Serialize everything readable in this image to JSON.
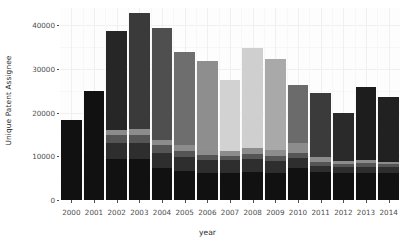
{
  "chart_data": {
    "type": "bar",
    "barmode": "stacked",
    "title": "",
    "xlabel": "year",
    "ylabel": "Unique Patent Assignee",
    "categories": [
      "2000",
      "2001",
      "2002",
      "2003",
      "2004",
      "2005",
      "2006",
      "2007",
      "2008",
      "2009",
      "2010",
      "2011",
      "2012",
      "2013",
      "2014"
    ],
    "ylim": [
      0,
      44000
    ],
    "yticks": [
      0,
      10000,
      20000,
      30000,
      40000
    ],
    "ytick_labels": [
      "0",
      "10000",
      "20000",
      "30000",
      "40000"
    ],
    "grid": true,
    "legend": "none",
    "totals": [
      18400,
      25000,
      38800,
      42800,
      39400,
      34000,
      31800,
      27600,
      34900,
      32300,
      26400,
      24500,
      19900,
      26000,
      23700
    ],
    "series": [
      {
        "name": "group-1",
        "color": "#111111",
        "values": [
          18400,
          25000,
          9300,
          9500,
          7300,
          6600,
          6300,
          6300,
          6500,
          6300,
          7400,
          6400,
          6200,
          6300,
          6300
        ]
      },
      {
        "name": "group-2",
        "color": "#2e2e2e",
        "values": [
          0,
          0,
          3800,
          3600,
          3500,
          3200,
          2900,
          2800,
          2900,
          2700,
          2200,
          1400,
          1300,
          1300,
          1200
        ]
      },
      {
        "name": "group-3",
        "color": "#555555",
        "values": [
          0,
          0,
          1800,
          1900,
          1700,
          1500,
          1200,
          1100,
          1100,
          1100,
          1200,
          900,
          800,
          800,
          700
        ]
      },
      {
        "name": "group-4",
        "color": "#8c8c8c",
        "values": [
          0,
          0,
          1200,
          1300,
          1300,
          1200,
          1000,
          1100,
          1400,
          1300,
          2200,
          1100,
          700,
          700,
          600
        ]
      },
      {
        "name": "group-5",
        "color": "#454545",
        "values": [
          0,
          0,
          22700,
          26500,
          25600,
          21500,
          20400,
          16300,
          23000,
          20900,
          13400,
          14700,
          10900,
          16900,
          14900
        ]
      }
    ],
    "bar_fill_shades": [
      "#111111",
      "#0f0f0f",
      "#262626",
      "#3a3a3a",
      "#4f4f4f",
      "#6e6e6e",
      "#8e8e8e",
      "#d2d2d2",
      "#cfcfcf",
      "#a9a9a9",
      "#6b6b6b",
      "#3b3b3b",
      "#2a2a2a",
      "#1d1d1d",
      "#212121"
    ]
  },
  "axis": {
    "y_title": "Unique Patent Assignee",
    "x_title": "year"
  }
}
